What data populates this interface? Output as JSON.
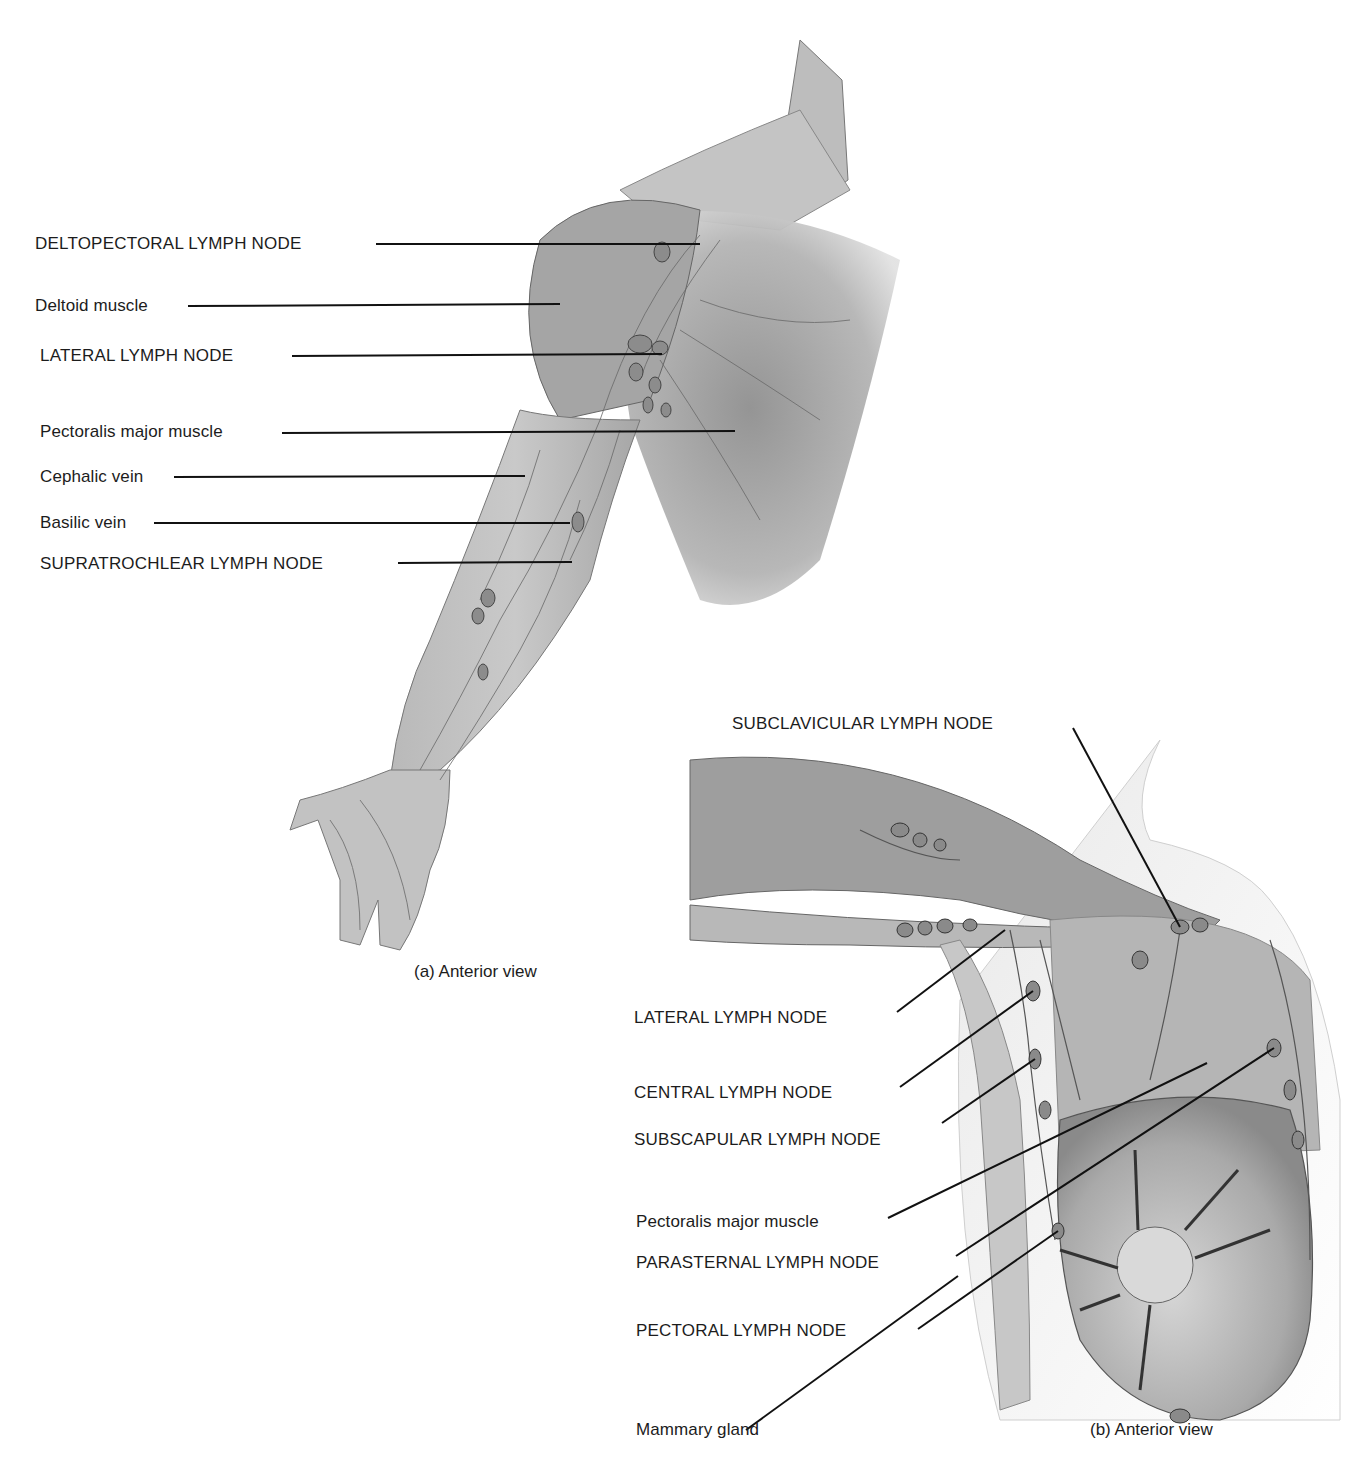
{
  "figure": {
    "panel_a": {
      "caption": "(a) Anterior view",
      "labels": [
        {
          "text": "DELTOPECTORAL LYMPH NODE",
          "x": 35,
          "y": 234,
          "line": [
            376,
            244,
            700,
            244
          ]
        },
        {
          "text": "Deltoid muscle",
          "x": 35,
          "y": 296,
          "line": [
            188,
            306,
            560,
            304
          ]
        },
        {
          "text": "LATERAL LYMPH NODE",
          "x": 40,
          "y": 346,
          "line": [
            292,
            356,
            662,
            354
          ]
        },
        {
          "text": "Pectoralis major muscle",
          "x": 40,
          "y": 422,
          "line": [
            282,
            433,
            735,
            431
          ]
        },
        {
          "text": "Cephalic vein",
          "x": 40,
          "y": 467,
          "line": [
            174,
            477,
            525,
            476
          ]
        },
        {
          "text": "Basilic vein",
          "x": 40,
          "y": 513,
          "line": [
            154,
            523,
            570,
            523
          ]
        },
        {
          "text": "SUPRATROCHLEAR LYMPH NODE",
          "x": 40,
          "y": 554,
          "line": [
            398,
            563,
            572,
            562
          ]
        }
      ]
    },
    "panel_b": {
      "caption": "(b) Anterior view",
      "labels": [
        {
          "text": "SUBCLAVICULAR LYMPH NODE",
          "x": 732,
          "y": 714,
          "line": [
            1073,
            728,
            1180,
            927
          ]
        },
        {
          "text": "LATERAL LYMPH NODE",
          "x": 634,
          "y": 1008,
          "line": [
            897,
            1012,
            1005,
            930
          ]
        },
        {
          "text": "CENTRAL LYMPH NODE",
          "x": 634,
          "y": 1083,
          "line": [
            900,
            1087,
            1033,
            991
          ]
        },
        {
          "text": "SUBSCAPULAR LYMPH NODE",
          "x": 634,
          "y": 1130,
          "line": [
            942,
            1123,
            1035,
            1059
          ]
        },
        {
          "text": "Pectoralis major muscle",
          "x": 636,
          "y": 1212,
          "line": [
            888,
            1218,
            1207,
            1063
          ]
        },
        {
          "text": "PARASTERNAL LYMPH NODE",
          "x": 636,
          "y": 1253,
          "line": [
            956,
            1256,
            1274,
            1048
          ]
        },
        {
          "text": "PECTORAL LYMPH NODE",
          "x": 636,
          "y": 1321,
          "line": [
            918,
            1329,
            1058,
            1231
          ]
        },
        {
          "text": "Mammary gland",
          "x": 636,
          "y": 1420,
          "line": [
            746,
            1430,
            958,
            1276
          ]
        }
      ]
    }
  }
}
